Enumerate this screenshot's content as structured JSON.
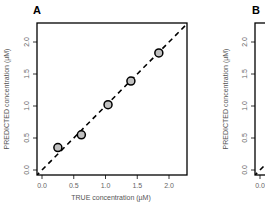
{
  "chart_data": [
    {
      "panel": "A",
      "type": "scatter",
      "title": "A",
      "xlabel": "TRUE concentration (µM)",
      "ylabel": "PREDICTED concentration (µM)",
      "xlim": [
        -0.1,
        2.3
      ],
      "ylim": [
        -0.05,
        2.25
      ],
      "xticks": [
        "0.0",
        "0.5",
        "1.0",
        "1.5",
        "2.0"
      ],
      "yticks": [
        "0.0",
        "0.5",
        "1.0",
        "1.5",
        "2.0"
      ],
      "grid": false,
      "reference_line": "y = x (dashed)",
      "point_color": "#c0c0c0",
      "points": [
        {
          "x": 0.25,
          "y": 0.35
        },
        {
          "x": 0.62,
          "y": 0.55
        },
        {
          "x": 1.04,
          "y": 1.02
        },
        {
          "x": 1.4,
          "y": 1.39
        },
        {
          "x": 1.84,
          "y": 1.83
        }
      ]
    },
    {
      "panel": "B",
      "type": "scatter",
      "title": "B",
      "xlabel": "",
      "ylabel": "PREDICTED concentration (µM)",
      "xlim": [
        -0.1,
        2.3
      ],
      "ylim": [
        -0.05,
        2.25
      ],
      "xticks": [
        "0.0"
      ],
      "yticks": [
        "0.0",
        "0.5",
        "1.0",
        "1.5",
        "2.0"
      ],
      "grid": false,
      "reference_line": "y = x (dashed)",
      "points": []
    }
  ]
}
